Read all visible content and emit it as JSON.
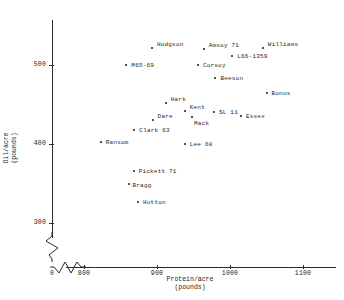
{
  "chart_data": {
    "type": "scatter",
    "title": "",
    "xlabel": "Protein/acre\n(pounds)",
    "ylabel": "Oil/acre\n(pounds)",
    "xlim": [
      760,
      1130
    ],
    "ylim": [
      280,
      545
    ],
    "grid": false,
    "legend": "none",
    "xticks": [
      0,
      800,
      900,
      1000,
      1100
    ],
    "yticks": [
      300,
      400,
      500
    ],
    "axis_breaks": [
      "x-axis",
      "y-axis"
    ],
    "points": [
      {
        "label": "Hodgson",
        "x": 893,
        "y": 522,
        "label_dx": 5,
        "label_dy": -7
      },
      {
        "label": "Amsoy 71",
        "x": 964,
        "y": 520,
        "label_dx": 5,
        "label_dy": -7
      },
      {
        "label": "L66-1359",
        "x": 1003,
        "y": 511,
        "label_dx": 5,
        "label_dy": -3
      },
      {
        "label": "Williams",
        "x": 1045,
        "y": 522,
        "label_dx": 5,
        "label_dy": -7
      },
      {
        "label": "M65-69",
        "x": 858,
        "y": 500,
        "label_dx": 5,
        "label_dy": -3
      },
      {
        "label": "Corsoy",
        "x": 956,
        "y": 500,
        "label_dx": 5,
        "label_dy": -3
      },
      {
        "label": "Beeson",
        "x": 980,
        "y": 483,
        "label_dx": 5,
        "label_dy": -3
      },
      {
        "label": "Bonus",
        "x": 1050,
        "y": 465,
        "label_dx": 5,
        "label_dy": -3
      },
      {
        "label": "Hark",
        "x": 912,
        "y": 452,
        "label_dx": 5,
        "label_dy": -7
      },
      {
        "label": "Kent",
        "x": 938,
        "y": 442,
        "label_dx": 5,
        "label_dy": -7
      },
      {
        "label": "SL 11",
        "x": 978,
        "y": 441,
        "label_dx": 5,
        "label_dy": -3
      },
      {
        "label": "Essex",
        "x": 1015,
        "y": 436,
        "label_dx": 5,
        "label_dy": -3
      },
      {
        "label": "Mack",
        "x": 948,
        "y": 434,
        "label_dx": 2,
        "label_dy": 3
      },
      {
        "label": "Dare",
        "x": 894,
        "y": 431,
        "label_dx": 5,
        "label_dy": -7
      },
      {
        "label": "Clark 63",
        "x": 869,
        "y": 418,
        "label_dx": 5,
        "label_dy": -3
      },
      {
        "label": "Ransom",
        "x": 823,
        "y": 403,
        "label_dx": 5,
        "label_dy": -3
      },
      {
        "label": "Lee 68",
        "x": 938,
        "y": 400,
        "label_dx": 5,
        "label_dy": -3
      },
      {
        "label": "Pickett 71",
        "x": 868,
        "y": 366,
        "label_dx": 5,
        "label_dy": -3
      },
      {
        "label": "Bragg",
        "x": 861,
        "y": 349,
        "label_dx": 4,
        "label_dy": -2
      },
      {
        "label": "Hutton",
        "x": 874,
        "y": 327,
        "label_dx": 5,
        "label_dy": -3
      }
    ]
  }
}
